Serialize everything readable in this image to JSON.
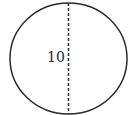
{
  "diagram": {
    "shape": "circle",
    "measure_line": "diameter",
    "line_style": "dashed",
    "label": "10",
    "stroke_color": "#2a2a2a",
    "background": "#ffffff"
  }
}
